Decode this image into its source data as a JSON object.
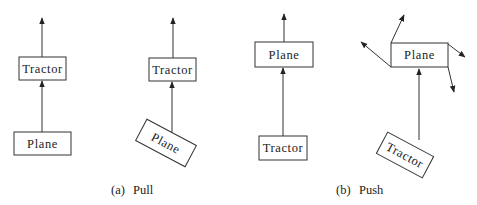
{
  "figure": {
    "panels": [
      {
        "id": "a",
        "caption_tag": "(a)",
        "caption_text": "Pull",
        "configs": [
          {
            "top_box": "Tractor",
            "bottom_box": "Plane",
            "bottom_tilted": false
          },
          {
            "top_box": "Tractor",
            "bottom_box": "Plane",
            "bottom_tilted": true
          }
        ]
      },
      {
        "id": "b",
        "caption_tag": "(b)",
        "caption_text": "Push",
        "configs": [
          {
            "top_box": "Plane",
            "bottom_box": "Tractor",
            "bottom_tilted": false
          },
          {
            "top_box": "Plane",
            "bottom_box": "Tractor",
            "bottom_tilted": true
          }
        ]
      }
    ]
  }
}
